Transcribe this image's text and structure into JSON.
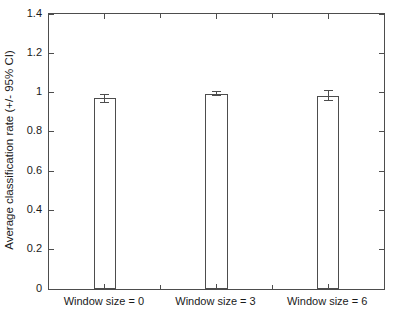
{
  "chart_data": {
    "type": "bar",
    "categories": [
      "Window size = 0",
      "Window size = 3",
      "Window size = 6"
    ],
    "values": [
      0.97,
      0.995,
      0.985
    ],
    "errors": [
      0.02,
      0.009,
      0.025
    ],
    "title": "",
    "xlabel": "",
    "ylabel": "Average classification rate (+/- 95% CI)",
    "ylim": [
      0,
      1.4
    ],
    "yticks": [
      0,
      0.2,
      0.4,
      0.6,
      0.8,
      1,
      1.2,
      1.4
    ],
    "ytick_labels": [
      "0",
      "0.2",
      "0.4",
      "0.6",
      "0.8",
      "1",
      "1.2",
      "1.4"
    ],
    "xlim": [
      0.5,
      3.5
    ],
    "x_positions": [
      1,
      2,
      3
    ],
    "x_minor_ticks": [
      1.5,
      2.5
    ],
    "bar_width_units": 0.2,
    "grid": false,
    "legend": null,
    "box": true
  },
  "colors": {
    "background": "#ffffff",
    "bar_fill": "#ffffff",
    "bar_edge": "#4d4d4d",
    "axis": "#4d4d4d",
    "text": "#1a1a1a"
  }
}
